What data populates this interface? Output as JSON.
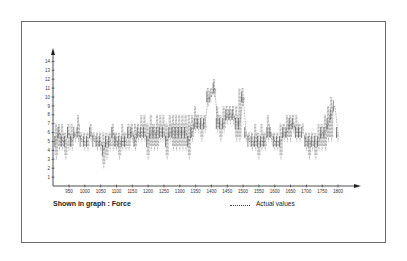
{
  "chart_data": {
    "type": "line",
    "title": "",
    "caption": "Shown in graph : Force",
    "xlabel": "",
    "ylabel": "",
    "legend": [
      {
        "name": "Actual values",
        "style": "dotted"
      }
    ],
    "legend_position": "bottom-right",
    "grid": false,
    "xlim": [
      905,
      1815
    ],
    "ylim": [
      0,
      15
    ],
    "x_ticks": [
      950,
      1000,
      1050,
      1100,
      1150,
      1200,
      1250,
      1300,
      1350,
      1400,
      1450,
      1500,
      1550,
      1600,
      1650,
      1700,
      1750,
      1800
    ],
    "y_ticks": [
      1,
      2,
      3,
      4,
      5,
      6,
      7,
      8,
      9,
      10,
      11,
      12,
      13,
      14
    ],
    "series": [
      {
        "name": "Actual values",
        "x": [
          910,
          920,
          930,
          940,
          950,
          960,
          970,
          980,
          990,
          1000,
          1010,
          1020,
          1030,
          1040,
          1050,
          1060,
          1070,
          1080,
          1090,
          1100,
          1110,
          1120,
          1130,
          1140,
          1150,
          1160,
          1170,
          1180,
          1190,
          1200,
          1210,
          1220,
          1230,
          1240,
          1250,
          1260,
          1270,
          1280,
          1290,
          1300,
          1310,
          1320,
          1330,
          1340,
          1350,
          1360,
          1370,
          1380,
          1390,
          1400,
          1410,
          1420,
          1430,
          1440,
          1450,
          1460,
          1470,
          1480,
          1490,
          1500,
          1510,
          1520,
          1530,
          1540,
          1550,
          1560,
          1570,
          1580,
          1590,
          1600,
          1610,
          1620,
          1630,
          1640,
          1650,
          1660,
          1670,
          1680,
          1690,
          1700,
          1710,
          1720,
          1730,
          1740,
          1750,
          1760,
          1770,
          1780,
          1790,
          1800
        ],
        "min": [
          3,
          4,
          4,
          3,
          4,
          4,
          5,
          5,
          5,
          4,
          4,
          5,
          5,
          4,
          4,
          2,
          3,
          4,
          4,
          4,
          3,
          4,
          4,
          4,
          5,
          4,
          5,
          5,
          5,
          3,
          4,
          4,
          4,
          5,
          5,
          3,
          5,
          4,
          4,
          4,
          4,
          4,
          3,
          5,
          6,
          6,
          5,
          6,
          9,
          10,
          10,
          6,
          5,
          6,
          7,
          7,
          7,
          5,
          5,
          9,
          5,
          5,
          4,
          4,
          3,
          4,
          4,
          5,
          5,
          4,
          4,
          3,
          5,
          5,
          5,
          6,
          5,
          5,
          6,
          4,
          3,
          4,
          3,
          4,
          4,
          4,
          5,
          5,
          6,
          5
        ],
        "max": [
          7,
          7,
          7,
          6,
          7,
          7,
          6,
          8,
          6,
          6,
          6,
          7,
          6,
          6,
          6,
          6,
          6,
          6,
          7,
          6,
          6,
          7,
          6,
          7,
          7,
          7,
          7,
          8,
          8,
          7,
          8,
          7,
          8,
          8,
          8,
          7,
          8,
          8,
          8,
          8,
          8,
          8,
          8,
          8,
          9,
          8,
          8,
          8,
          11,
          11,
          12,
          9,
          8,
          9,
          9,
          9,
          9,
          9,
          11,
          11,
          6,
          6,
          6,
          7,
          6,
          7,
          6,
          8,
          6,
          6,
          6,
          7,
          7,
          8,
          8,
          8,
          8,
          7,
          7,
          6,
          6,
          6,
          6,
          7,
          7,
          8,
          9,
          10,
          6,
          6
        ],
        "values": [
          5,
          6,
          5,
          5,
          6,
          5,
          6,
          6,
          5,
          5,
          5,
          6,
          5,
          5,
          5,
          4,
          5,
          5,
          6,
          5,
          5,
          5,
          5,
          6,
          6,
          5,
          6,
          6,
          6,
          5,
          6,
          6,
          6,
          6,
          6,
          5,
          6,
          6,
          6,
          6,
          6,
          6,
          5,
          6,
          7,
          7,
          7,
          7,
          10,
          10,
          11,
          7,
          7,
          7,
          8,
          8,
          8,
          7,
          7,
          10,
          6,
          5,
          5,
          5,
          5,
          5,
          5,
          6,
          6,
          5,
          5,
          5,
          6,
          6,
          7,
          7,
          6,
          6,
          6,
          5,
          5,
          5,
          5,
          5,
          6,
          6,
          7,
          8,
          9,
          6
        ]
      }
    ]
  },
  "caption": "Shown in graph : Force",
  "legend_label": "Actual values"
}
